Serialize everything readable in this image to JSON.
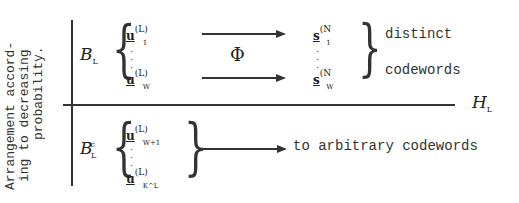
{
  "side_label": {
    "lines": [
      "Arrangement accord-",
      "ing to decreasing",
      "probability."
    ]
  },
  "top_set": {
    "set_symbol": "B",
    "set_sub": "L",
    "first_vector": {
      "symbol": "u",
      "superscript": "(L)",
      "subscript": "1"
    },
    "last_vector": {
      "symbol": "u",
      "superscript": "(L)",
      "subscript": "W"
    },
    "mapping_symbol": "Φ",
    "target_first": {
      "symbol": "s",
      "superscript": "(N",
      "subscript": "1"
    },
    "target_last": {
      "symbol": "s",
      "superscript": "(N",
      "subscript": "W"
    },
    "label_line1": "distinct",
    "label_line2": "codewords"
  },
  "divider": {
    "symbol": "H",
    "sub": "L"
  },
  "bottom_set": {
    "set_symbol": "B",
    "set_sub": "L",
    "set_sup": "c",
    "first_vector": {
      "symbol": "u",
      "superscript": "(L)",
      "subscript": "W+1"
    },
    "last_vector": {
      "symbol": "u",
      "superscript": "(L)",
      "subscript": "K^L"
    },
    "label": "to arbitrary codewords"
  }
}
